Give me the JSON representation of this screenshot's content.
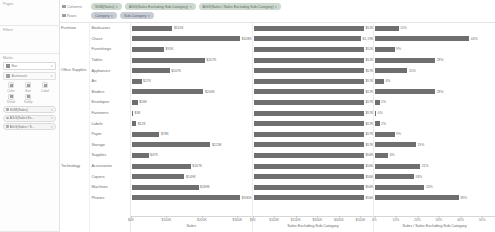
{
  "panes": {
    "pages_title": "Pages",
    "filters_title": "Filters",
    "marks_title": "Marks"
  },
  "marks": {
    "type_label": "Bar",
    "type_icon": "bar-mark-icon",
    "automatic_label": "Automatic",
    "buttons": [
      {
        "label": "Color",
        "icon": "color-icon"
      },
      {
        "label": "Size",
        "icon": "size-icon"
      },
      {
        "label": "Label",
        "icon": "label-icon"
      },
      {
        "label": "Detail",
        "icon": "detail-icon"
      },
      {
        "label": "Tooltip",
        "icon": "tooltip-icon"
      }
    ],
    "pills": [
      {
        "label": "SUM(Sales)",
        "icon": "measure-icon"
      },
      {
        "label": "AGG(Sales Ex...",
        "icon": "measure-icon"
      },
      {
        "label": "AGG(Sales / S...",
        "icon": "measure-icon"
      }
    ]
  },
  "shelves": {
    "columns_label": "Columns",
    "rows_label": "Rows",
    "columns_pills": [
      "SUM(Sales)",
      "AGG(Sales Excluding Sub-Category)",
      "AGG(Sales / Sales Excluding Sub-Category)"
    ],
    "rows_pills": [
      "Category",
      "Sub-Category"
    ]
  },
  "chart_data": {
    "type": "bar",
    "title": "",
    "categories": [
      "Bookcases",
      "Chairs",
      "Furnishings",
      "Tables",
      "Appliances",
      "Art",
      "Binders",
      "Envelopes",
      "Fasteners",
      "Labels",
      "Paper",
      "Storage",
      "Supplies",
      "Accessories",
      "Copiers",
      "Machines",
      "Phones"
    ],
    "category_groups": [
      {
        "name": "Furniture",
        "count": 4
      },
      {
        "name": "Office Supplies",
        "count": 9
      },
      {
        "name": "Technology",
        "count": 4
      }
    ],
    "panels": [
      {
        "id": "sales",
        "xlabel": "Sales",
        "ticks": [
          "$0K",
          "$100K",
          "$200K",
          "$300K"
        ],
        "tick_values": [
          0,
          100000,
          200000,
          300000
        ],
        "xlim": [
          0,
          340000
        ],
        "value_format": "currency-k",
        "values": [
          115000,
          328000,
          91000,
          207000,
          107000,
          27000,
          203000,
          16000,
          3000,
          12000,
          78000,
          223000,
          47000,
          167000,
          149000,
          189000,
          330000
        ],
        "labels": [
          "$115K",
          "$328K",
          "$91K",
          "$207K",
          "$107K",
          "$27K",
          "$203K",
          "$16K",
          "$3K",
          "$12K",
          "$78K",
          "$223K",
          "$47K",
          "$167K",
          "$149K",
          "$189K",
          "$330K"
        ]
      },
      {
        "id": "sales-excluding",
        "xlabel": "Sales Excluding Sub-Category",
        "ticks": [
          "$0K",
          "$100K",
          "$200K",
          "$300K",
          "$400K",
          "$500K"
        ],
        "tick_values": [
          0,
          100000,
          200000,
          300000,
          400000,
          500000
        ],
        "xlim": [
          0,
          560000
        ],
        "value_format": "currency-k",
        "values": [
          527000,
          542000,
          522000,
          532000,
          579000,
          590000,
          596000,
          597000,
          598000,
          598000,
          593000,
          596000,
          590000,
          584000,
          584000,
          584000,
          584000
        ],
        "labels": [
          "$52K",
          "$1.19K",
          "$52K",
          "$52K",
          "$57K",
          "$57K",
          "$57K",
          "$57K",
          "$57K",
          "$57K",
          "$57K",
          "$57K",
          "$56K",
          "$56K",
          "$56K",
          "$56K",
          "$56K"
        ]
      },
      {
        "id": "sales-ratio",
        "xlabel": "Sales / Sales Excluding Sub-Category",
        "ticks": [
          "0%",
          "10%",
          "20%",
          "30%",
          "40%",
          "50%"
        ],
        "tick_values": [
          0,
          10,
          20,
          30,
          40,
          50
        ],
        "xlim": [
          0,
          56
        ],
        "value_format": "percent",
        "values": [
          11,
          44,
          9,
          28,
          15,
          4,
          28,
          2,
          0.4,
          2,
          9,
          19,
          6,
          21,
          18,
          23,
          39
        ],
        "labels": [
          "11%",
          "44%",
          "9%",
          "28%",
          "15%",
          "4%",
          "28%",
          "2%",
          "0%",
          "2%",
          "9%",
          "19%",
          "6%",
          "21%",
          "18%",
          "23%",
          "39%"
        ]
      }
    ]
  },
  "colors": {
    "bar": "#6f6f6f",
    "pill_green": "#cdd8cf",
    "pill_blue": "#c8ccd4",
    "grid": "#ededed"
  }
}
